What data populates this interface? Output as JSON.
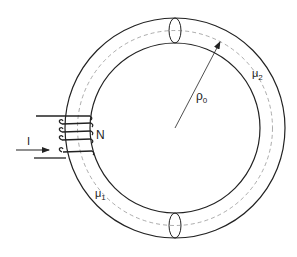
{
  "diagram": {
    "labels": {
      "current": "I",
      "turns": "N",
      "radius": "ρ",
      "radius_sub": "0",
      "mu1": "μ",
      "mu1_sub": "1",
      "mu2": "μ",
      "mu2_sub": "2"
    },
    "colors": {
      "stroke": "#222222",
      "dashed": "#777777",
      "background": "#ffffff"
    }
  }
}
